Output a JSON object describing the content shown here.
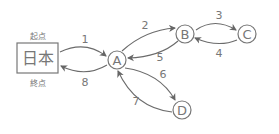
{
  "diagram": {
    "start_node": {
      "label": "日本",
      "top_label": "起点",
      "bottom_label": "終点"
    },
    "nodes": [
      {
        "id": "A",
        "label": "A"
      },
      {
        "id": "B",
        "label": "B"
      },
      {
        "id": "C",
        "label": "C"
      },
      {
        "id": "D",
        "label": "D"
      }
    ],
    "edges": [
      {
        "from": "日本",
        "to": "A",
        "label": "1"
      },
      {
        "from": "A",
        "to": "B",
        "label": "2"
      },
      {
        "from": "B",
        "to": "C",
        "label": "3"
      },
      {
        "from": "C",
        "to": "B",
        "label": "4"
      },
      {
        "from": "B",
        "to": "A",
        "label": "5"
      },
      {
        "from": "A",
        "to": "D",
        "label": "6"
      },
      {
        "from": "D",
        "to": "A",
        "label": "7"
      },
      {
        "from": "A",
        "to": "日本",
        "label": "8"
      }
    ],
    "colors": {
      "stroke": "#6b6b6b",
      "text": "#777777"
    }
  }
}
